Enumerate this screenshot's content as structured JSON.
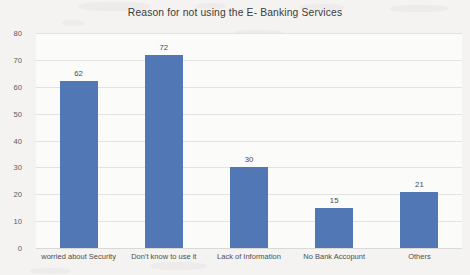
{
  "chart_data": {
    "type": "bar",
    "title": "Reason for not using the E- Banking Services",
    "xlabel": "",
    "ylabel": "",
    "categories": [
      "worried about Security",
      "Don't know to use it",
      "Lack of Information",
      "No Bank Accopunt",
      "Others"
    ],
    "values": [
      62,
      72,
      30,
      15,
      21
    ],
    "data_labels": [
      "62",
      "72",
      "30",
      "15",
      "21"
    ],
    "ylim": [
      0,
      80
    ],
    "ytick_labels": [
      "0",
      "10",
      "20",
      "30",
      "40",
      "50",
      "60",
      "70",
      "80"
    ],
    "ytick_values": [
      0,
      10,
      20,
      30,
      40,
      50,
      60,
      70,
      80
    ],
    "grid": true,
    "legend": false,
    "legend_position": "none",
    "series": [
      {
        "name": "Reason for not using the E- Banking Services",
        "values": [
          62,
          72,
          30,
          15,
          21
        ],
        "color": "#5277b5"
      }
    ]
  },
  "colors": {
    "bar": "#5277b5",
    "gridline": "#e3e3e1",
    "plot_background": "#fbfbfa",
    "figure_background": "#f4f3f1",
    "title_text": "#3b3b3b",
    "tick_text": "#5b5b5b"
  }
}
